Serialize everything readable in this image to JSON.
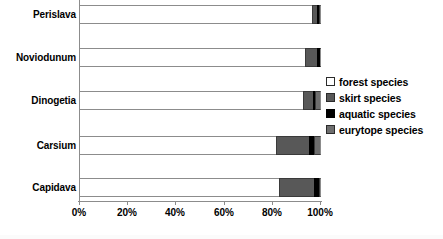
{
  "chart_data": {
    "type": "bar",
    "orientation": "horizontal",
    "stacked": true,
    "normalized": true,
    "title": "",
    "xlabel": "",
    "ylabel": "",
    "xlim": [
      0,
      100
    ],
    "grid": false,
    "legend_position": "right",
    "categories": [
      "Capidava",
      "Carsium",
      "Dinogetia",
      "Noviodunum",
      "Perislava"
    ],
    "xticks": [
      "0%",
      "20%",
      "40%",
      "60%",
      "80%",
      "100%"
    ],
    "xtick_values": [
      0,
      20,
      40,
      60,
      80,
      100
    ],
    "series": [
      {
        "name": "forest species",
        "color": "#ffffff",
        "values": [
          82.5,
          81.5,
          92.5,
          93.5,
          96.5
        ]
      },
      {
        "name": "skirt species",
        "color": "#585858",
        "values": [
          14.5,
          13.5,
          4.0,
          5.0,
          2.0
        ]
      },
      {
        "name": "aquatic species",
        "color": "#000000",
        "values": [
          2.0,
          2.0,
          1.0,
          1.5,
          1.0
        ]
      },
      {
        "name": "eurytope species",
        "color": "#6e6e6e",
        "values": [
          1.0,
          3.0,
          2.5,
          0.0,
          0.5
        ]
      }
    ]
  },
  "axis": {
    "category_labels": [
      {
        "label": "Perislava"
      },
      {
        "label": "Noviodunum"
      },
      {
        "label": "Dinogetia"
      },
      {
        "label": "Carsium"
      },
      {
        "label": "Capidava"
      }
    ],
    "x_tick_labels": [
      "0%",
      "20%",
      "40%",
      "60%",
      "80%",
      "100%"
    ]
  },
  "legend": {
    "items": [
      {
        "label": "forest species",
        "swatch": "forest-swatch"
      },
      {
        "label": "skirt species",
        "swatch": "skirt-swatch"
      },
      {
        "label": "aquatic species",
        "swatch": "aquatic-swatch"
      },
      {
        "label": "eurytope species",
        "swatch": "eurytope-swatch"
      }
    ]
  }
}
